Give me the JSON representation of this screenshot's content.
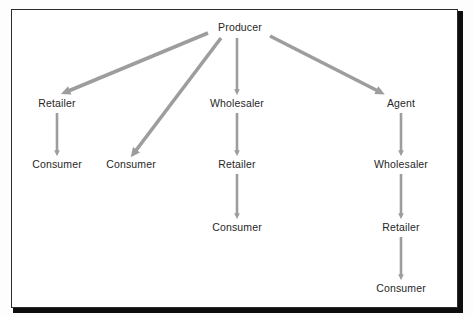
{
  "diagram": {
    "type": "flow-diagram",
    "colors": {
      "arrow": "#9d9d9d",
      "text": "#272727",
      "border": "#2b2b2b",
      "shadow": "#0d0d0d",
      "background": "#ffffff"
    },
    "nodes": [
      {
        "id": "producer",
        "label": "Producer",
        "x": 240,
        "y": 27
      },
      {
        "id": "retailer_1",
        "label": "Retailer",
        "x": 57,
        "y": 103
      },
      {
        "id": "consumer_1",
        "label": "Consumer",
        "x": 57,
        "y": 164
      },
      {
        "id": "consumer_2",
        "label": "Consumer",
        "x": 131,
        "y": 164
      },
      {
        "id": "wholesaler_1",
        "label": "Wholesaler",
        "x": 237,
        "y": 103
      },
      {
        "id": "retailer_2",
        "label": "Retailer",
        "x": 237,
        "y": 164
      },
      {
        "id": "consumer_3",
        "label": "Consumer",
        "x": 237,
        "y": 227
      },
      {
        "id": "agent",
        "label": "Agent",
        "x": 401,
        "y": 103
      },
      {
        "id": "wholesaler_2",
        "label": "Wholesaler",
        "x": 401,
        "y": 164
      },
      {
        "id": "retailer_3",
        "label": "Retailer",
        "x": 401,
        "y": 227
      },
      {
        "id": "consumer_4",
        "label": "Consumer",
        "x": 401,
        "y": 288
      }
    ],
    "edges": [
      {
        "id": "producer-to-retailer1",
        "from": "producer",
        "to": "retailer_1",
        "x1": 208,
        "y1": 33,
        "x2": 66,
        "y2": 92,
        "weight": "thick"
      },
      {
        "id": "producer-to-consumer2",
        "from": "producer",
        "to": "consumer_2",
        "x1": 221,
        "y1": 38,
        "x2": 134,
        "y2": 153,
        "weight": "thick"
      },
      {
        "id": "producer-to-wholesaler1",
        "from": "producer",
        "to": "wholesaler_1",
        "x1": 237,
        "y1": 38,
        "x2": 237,
        "y2": 92,
        "weight": "thin"
      },
      {
        "id": "producer-to-agent",
        "from": "producer",
        "to": "agent",
        "x1": 270,
        "y1": 36,
        "x2": 380,
        "y2": 92,
        "weight": "thick"
      },
      {
        "id": "retailer1-to-consumer1",
        "from": "retailer_1",
        "to": "consumer_1",
        "x1": 57,
        "y1": 113,
        "x2": 57,
        "y2": 153,
        "weight": "thin"
      },
      {
        "id": "wholesaler1-to-retailer2",
        "from": "wholesaler_1",
        "to": "retailer_2",
        "x1": 237,
        "y1": 113,
        "x2": 237,
        "y2": 153,
        "weight": "thin"
      },
      {
        "id": "retailer2-to-consumer3",
        "from": "retailer_2",
        "to": "consumer_3",
        "x1": 237,
        "y1": 174,
        "x2": 237,
        "y2": 216,
        "weight": "thin"
      },
      {
        "id": "agent-to-wholesaler2",
        "from": "agent",
        "to": "wholesaler_2",
        "x1": 401,
        "y1": 113,
        "x2": 401,
        "y2": 153,
        "weight": "thin"
      },
      {
        "id": "wholesaler2-to-retailer3",
        "from": "wholesaler_2",
        "to": "retailer_3",
        "x1": 401,
        "y1": 174,
        "x2": 401,
        "y2": 216,
        "weight": "thin"
      },
      {
        "id": "retailer3-to-consumer4",
        "from": "retailer_3",
        "to": "consumer_4",
        "x1": 401,
        "y1": 237,
        "x2": 401,
        "y2": 277,
        "weight": "thin"
      }
    ]
  }
}
